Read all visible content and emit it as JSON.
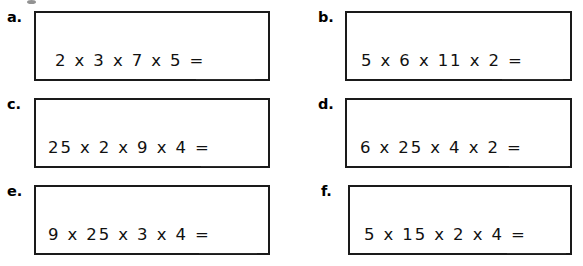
{
  "worksheet": {
    "type": "multiplication-practice",
    "columns": 2,
    "rows": 3,
    "operator": "x",
    "equals": "=",
    "answer_blank": "______",
    "problems": [
      {
        "label": "a.",
        "expression": "2 x 3 x 7 x 5 =",
        "factors": [
          2,
          3,
          7,
          5
        ],
        "answer": ""
      },
      {
        "label": "b.",
        "expression": "5 x 6 x 11 x 2 =",
        "factors": [
          5,
          6,
          11,
          2
        ],
        "answer": ""
      },
      {
        "label": "c.",
        "expression": "25 x 2 x 9 x 4 =",
        "factors": [
          25,
          2,
          9,
          4
        ],
        "answer": ""
      },
      {
        "label": "d.",
        "expression": "6 x 25 x 4 x 2 =",
        "factors": [
          6,
          25,
          4,
          2
        ],
        "answer": ""
      },
      {
        "label": "e.",
        "expression": "9 x 25 x 3 x 4 =",
        "factors": [
          9,
          25,
          3,
          4
        ],
        "answer": ""
      },
      {
        "label": "f.",
        "expression": "5 x 15 x 2 x 4 =",
        "factors": [
          5,
          15,
          2,
          4
        ],
        "answer": ""
      }
    ]
  },
  "colors": {
    "ink": "#000000",
    "box_border": "#1a1a1a",
    "blank_rule": "#2b2b2b",
    "page": "#ffffff"
  }
}
